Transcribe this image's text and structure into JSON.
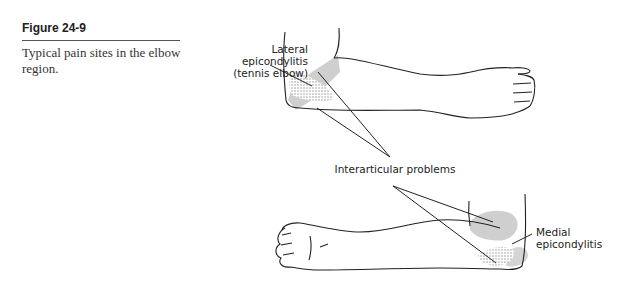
{
  "figure": {
    "label": "Figure 24-9",
    "caption": "Typical pain sites in the elbow region."
  },
  "illustration": {
    "description": "Line drawing of two arms (lateral and medial views) with shaded pain regions at the elbow",
    "annotations": {
      "lateral": [
        "Lateral",
        "epicondylitis",
        "(tennis elbow)"
      ],
      "interarticular": "Interarticular problems",
      "medial": [
        "Medial",
        "epicondylitis"
      ]
    },
    "colors": {
      "line": "#222222",
      "shade": "#c8c8c8",
      "stipple": "#888888"
    }
  }
}
